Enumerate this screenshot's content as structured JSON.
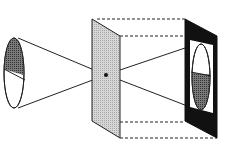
{
  "diagram": {
    "colors": {
      "stroke": "#222222",
      "dark_fill": "#555555",
      "plate_fill": "#cccccc",
      "screen_fill": "#111111",
      "background": "#ffffff"
    },
    "elements": {
      "object": "object-ellipse (top half shaded)",
      "barrier": "pinhole-plate",
      "screen": "image-screen (inverted image, bottom half shaded)"
    },
    "caption": ""
  }
}
